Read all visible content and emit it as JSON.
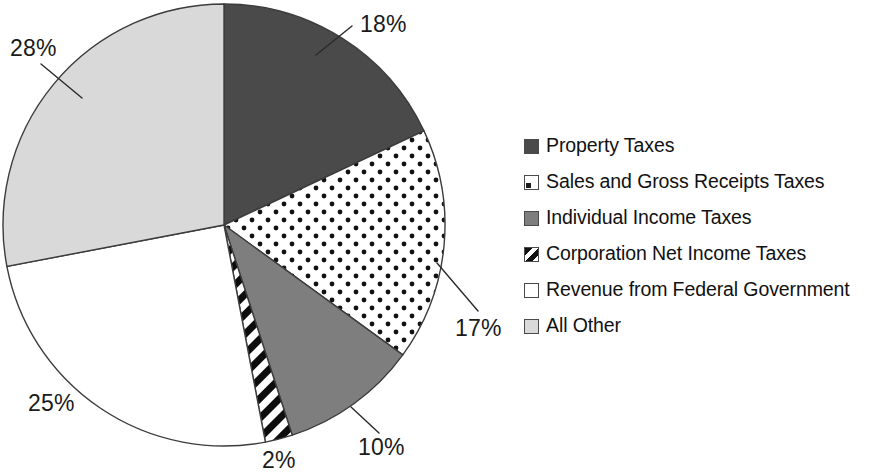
{
  "chart_data": {
    "type": "pie",
    "title": "",
    "subtitle": "",
    "xlabel": "",
    "ylabel": "",
    "grid": false,
    "legend_position": "right",
    "start_angle_deg": 0,
    "direction": "clockwise",
    "units": "percent",
    "categories": [
      "Property Taxes",
      "Sales and Gross Receipts Taxes",
      "Individual Income Taxes",
      "Corporation Net Income Taxes",
      "Revenue from Federal Government",
      "All Other"
    ],
    "values": [
      18,
      17,
      10,
      2,
      25,
      28
    ],
    "data_labels": [
      "18%",
      "17%",
      "10%",
      "2%",
      "25%",
      "28%"
    ],
    "slices": [
      {
        "label": "Property Taxes",
        "value": 18,
        "data_label": "18%",
        "fill": "solid-dark",
        "color": "#4a4a4a",
        "start_deg": 0,
        "end_deg": 64.8,
        "has_leader": true,
        "label_x": 360,
        "label_y": 32,
        "leader": "M 316,55 L 352,26"
      },
      {
        "label": "Sales and Gross Receipts Taxes",
        "value": 17,
        "data_label": "17%",
        "fill": "dots",
        "color": "#ffffff",
        "start_deg": 64.8,
        "end_deg": 126.0,
        "has_leader": true,
        "label_x": 455,
        "label_y": 336,
        "leader": "M 437,263 L 478,311"
      },
      {
        "label": "Individual Income Taxes",
        "value": 10,
        "data_label": "10%",
        "fill": "solid-mid",
        "color": "#7e7e7e",
        "start_deg": 126.0,
        "end_deg": 162.0,
        "has_leader": true,
        "label_x": 358,
        "label_y": 455,
        "leader": "M 351,407 L 379,433"
      },
      {
        "label": "Corporation Net Income Taxes",
        "value": 2,
        "data_label": "2%",
        "fill": "hatch",
        "color": "#111111",
        "start_deg": 162.0,
        "end_deg": 169.2,
        "has_leader": false,
        "label_x": 262,
        "label_y": 468,
        "leader": ""
      },
      {
        "label": "Revenue from Federal Government",
        "value": 25,
        "data_label": "25%",
        "fill": "white",
        "color": "#ffffff",
        "start_deg": 169.2,
        "end_deg": 259.2,
        "has_leader": false,
        "label_x": 28,
        "label_y": 411,
        "leader": ""
      },
      {
        "label": "All Other",
        "value": 28,
        "data_label": "28%",
        "fill": "solid-light",
        "color": "#d9d9d9",
        "start_deg": 259.2,
        "end_deg": 360.0,
        "has_leader": true,
        "label_x": 10,
        "label_y": 56,
        "leader": "M 41,64 L 82,98"
      }
    ],
    "geometry": {
      "center_x": 224,
      "center_y": 225,
      "radius": 221
    }
  },
  "legend": {
    "items": [
      {
        "label": "Property Taxes",
        "swatch": "solid-dark"
      },
      {
        "label": "Sales and Gross Receipts Taxes",
        "swatch": "dots"
      },
      {
        "label": "Individual Income Taxes",
        "swatch": "solid-mid"
      },
      {
        "label": "Corporation Net Income Taxes",
        "swatch": "hatch"
      },
      {
        "label": "Revenue from Federal Government",
        "swatch": "white"
      },
      {
        "label": "All Other",
        "swatch": "solid-light"
      }
    ]
  },
  "colors": {
    "property_taxes": "#4a4a4a",
    "sales_gross_receipts": "#ffffff",
    "individual_income": "#7e7e7e",
    "corporation_net_income": "#111111",
    "federal_revenue": "#ffffff",
    "all_other": "#d9d9d9",
    "outline": "#3c3c3c",
    "text": "#111111"
  }
}
